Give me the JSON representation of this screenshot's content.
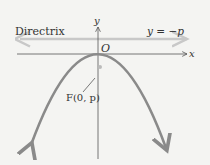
{
  "diagram": {
    "type": "parabola-focus-directrix",
    "labels": {
      "directrix": "Directrix",
      "directrix_equation": "y = −p",
      "origin": "O",
      "x_axis": "x",
      "y_axis": "y",
      "focus": "F(0, p)"
    },
    "colors": {
      "background": "#f4f4f2",
      "axes": "#555555",
      "parabola": "#8a8a8a",
      "directrix": "#c8c8c8",
      "focus_point": "#bbbbbb",
      "text": "#333333"
    }
  }
}
